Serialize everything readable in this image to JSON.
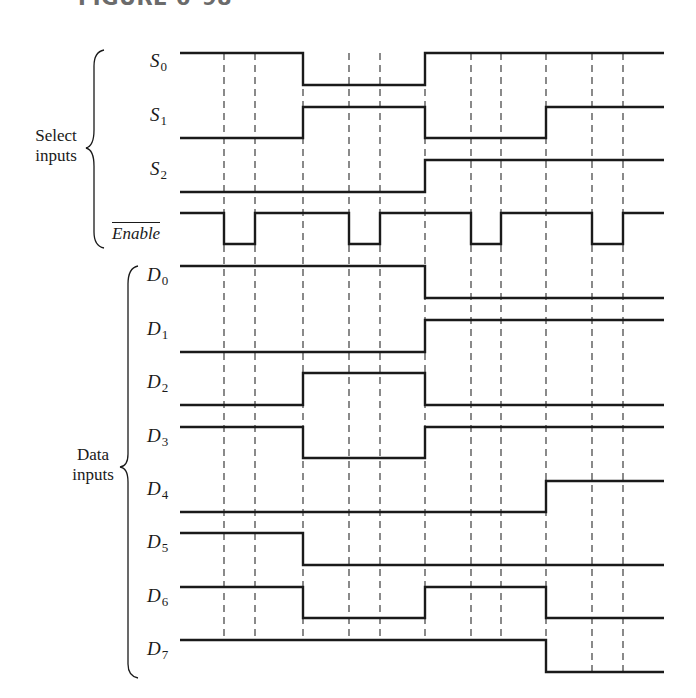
{
  "figure": {
    "title": "FIGURE 6–98"
  },
  "groups": {
    "select": {
      "line1": "Select",
      "line2": "inputs"
    },
    "data": {
      "line1": "Data",
      "line2": "inputs"
    }
  },
  "colors": {
    "line": "#1a1a1a",
    "dash": "#2a2a2a",
    "title": "#6b6b6b"
  },
  "chart_data": {
    "type": "timing",
    "title": "FIGURE 6–98",
    "time_edges_px": [
      180,
      224,
      255,
      303,
      349,
      380,
      425,
      471,
      501,
      546,
      592,
      623,
      664
    ],
    "dashed_guides_px": [
      224,
      255,
      303,
      349,
      380,
      425,
      471,
      501,
      546,
      592,
      623
    ],
    "signals": [
      {
        "name": "S",
        "sub": "0",
        "group": "select",
        "high_y": 53,
        "low_y": 85,
        "labelY": 62,
        "transitions": [
          [
            180,
            1
          ],
          [
            303,
            0
          ],
          [
            425,
            1
          ]
        ]
      },
      {
        "name": "S",
        "sub": "1",
        "group": "select",
        "high_y": 107,
        "low_y": 138,
        "labelY": 116,
        "transitions": [
          [
            180,
            0
          ],
          [
            303,
            1
          ],
          [
            425,
            0
          ],
          [
            546,
            1
          ]
        ]
      },
      {
        "name": "S",
        "sub": "2",
        "group": "select",
        "high_y": 160,
        "low_y": 192,
        "labelY": 170,
        "transitions": [
          [
            180,
            0
          ],
          [
            425,
            1
          ]
        ]
      },
      {
        "name": "Enable",
        "sub": "",
        "overbar": true,
        "group": "select",
        "high_y": 213,
        "low_y": 244,
        "labelY": 229,
        "transitions": [
          [
            180,
            1
          ],
          [
            224,
            0
          ],
          [
            255,
            1
          ],
          [
            349,
            0
          ],
          [
            380,
            1
          ],
          [
            471,
            0
          ],
          [
            501,
            1
          ],
          [
            592,
            0
          ],
          [
            623,
            1
          ]
        ]
      },
      {
        "name": "D",
        "sub": "0",
        "group": "data",
        "high_y": 266,
        "low_y": 298,
        "labelY": 276,
        "transitions": [
          [
            180,
            1
          ],
          [
            425,
            0
          ]
        ]
      },
      {
        "name": "D",
        "sub": "1",
        "group": "data",
        "high_y": 320,
        "low_y": 352,
        "labelY": 330,
        "transitions": [
          [
            180,
            0
          ],
          [
            425,
            1
          ]
        ]
      },
      {
        "name": "D",
        "sub": "2",
        "group": "data",
        "high_y": 373,
        "low_y": 405,
        "labelY": 383,
        "transitions": [
          [
            180,
            0
          ],
          [
            303,
            1
          ],
          [
            425,
            0
          ]
        ]
      },
      {
        "name": "D",
        "sub": "3",
        "group": "data",
        "high_y": 427,
        "low_y": 458,
        "labelY": 437,
        "transitions": [
          [
            180,
            1
          ],
          [
            303,
            0
          ],
          [
            425,
            1
          ]
        ]
      },
      {
        "name": "D",
        "sub": "4",
        "group": "data",
        "high_y": 481,
        "low_y": 512,
        "labelY": 490,
        "transitions": [
          [
            180,
            0
          ],
          [
            546,
            1
          ]
        ]
      },
      {
        "name": "D",
        "sub": "5",
        "group": "data",
        "high_y": 533,
        "low_y": 565,
        "labelY": 543,
        "transitions": [
          [
            180,
            1
          ],
          [
            303,
            0
          ]
        ]
      },
      {
        "name": "D",
        "sub": "6",
        "group": "data",
        "high_y": 587,
        "low_y": 618,
        "labelY": 597,
        "transitions": [
          [
            180,
            1
          ],
          [
            303,
            0
          ],
          [
            425,
            1
          ],
          [
            546,
            0
          ]
        ]
      },
      {
        "name": "D",
        "sub": "7",
        "group": "data",
        "high_y": 640,
        "low_y": 672,
        "labelY": 650,
        "transitions": [
          [
            180,
            1
          ],
          [
            546,
            0
          ]
        ]
      }
    ],
    "x_end": 664,
    "legend": [],
    "xlabel": "",
    "ylabel": ""
  }
}
